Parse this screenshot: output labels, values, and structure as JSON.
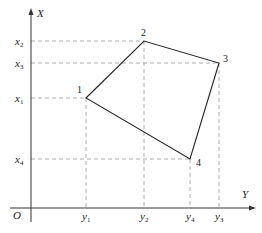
{
  "diagram": {
    "axes": {
      "vertical_label": "X",
      "horizontal_label": "Y",
      "origin_label": "O"
    },
    "x_ticks": [
      {
        "base": "x",
        "sub": "2",
        "y": 41
      },
      {
        "base": "x",
        "sub": "3",
        "y": 63
      },
      {
        "base": "x",
        "sub": "1",
        "y": 98
      },
      {
        "base": "x",
        "sub": "4",
        "y": 159
      }
    ],
    "y_ticks": [
      {
        "base": "y",
        "sub": "1",
        "x": 86
      },
      {
        "base": "y",
        "sub": "2",
        "x": 144
      },
      {
        "base": "y",
        "sub": "4",
        "x": 190
      },
      {
        "base": "y",
        "sub": "3",
        "x": 219
      }
    ],
    "points": [
      {
        "label": "1",
        "px": 86,
        "py": 98
      },
      {
        "label": "2",
        "px": 144,
        "py": 41
      },
      {
        "label": "3",
        "px": 219,
        "py": 63
      },
      {
        "label": "4",
        "px": 190,
        "py": 159
      }
    ],
    "colors": {
      "line": "#222222",
      "dash": "#999999"
    }
  }
}
